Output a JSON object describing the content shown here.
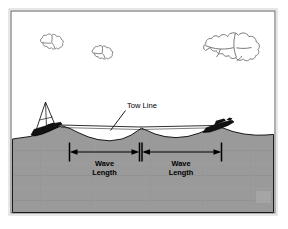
{
  "figure": {
    "background_color": "#ffffff",
    "frame": {
      "border_color": "#808080",
      "outer_border_color": "#c8c8c8"
    },
    "sky": {
      "fill": "#ffffff",
      "outline_color": "#6e6e6e"
    },
    "water": {
      "fill": "#9a9a9a",
      "outline_color": "#1a1a1a",
      "label": "water-body"
    },
    "labels": {
      "tow_line": "Tow Line",
      "wave_length_left_line1": "Wave",
      "wave_length_left_line2": "Length",
      "wave_length_right_line1": "Wave",
      "wave_length_right_line2": "Length"
    },
    "clouds": [
      {
        "name": "cloud-left",
        "cx": 56,
        "cy": 44
      },
      {
        "name": "cloud-center",
        "cx": 104,
        "cy": 52
      },
      {
        "name": "cloud-right-large",
        "cx": 232,
        "cy": 38
      }
    ],
    "vessels": [
      {
        "name": "tug-vessel-left",
        "label": "towing vessel with mast",
        "x": 50,
        "y": 130
      },
      {
        "name": "towed-object-right",
        "label": "towed barge",
        "x": 218,
        "y": 128
      }
    ],
    "dimensions": [
      {
        "name": "wave-length-left",
        "x_start": 69,
        "x_end": 139,
        "y": 152
      },
      {
        "name": "wave-length-right",
        "x_start": 141,
        "x_end": 221,
        "y": 152
      }
    ],
    "colors": {
      "ink": "#000000",
      "water_gray": "#9a9a9a",
      "frame_gray": "#808080",
      "cloud_outline": "#6e6e6e"
    }
  }
}
